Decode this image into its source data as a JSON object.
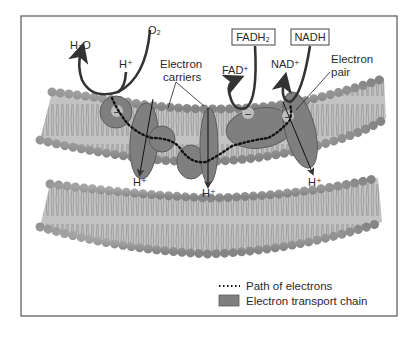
{
  "diagram": {
    "labels": {
      "h2o": "H₂O",
      "o2": "O₂",
      "h_plus_top": "H⁺",
      "electron_carriers_line1": "Electron",
      "electron_carriers_line2": "carriers",
      "fadh2": "FADH₂",
      "nadh": "NADH",
      "fad_plus": "FAD⁺",
      "nad_plus": "NAD⁺",
      "electron_pair_line1": "Electron",
      "electron_pair_line2": "pair",
      "h_plus_1": "H⁺",
      "h_plus_2": "H⁺",
      "h_plus_3": "H⁺",
      "electron_symbol": "–"
    },
    "legend": {
      "path": "Path of electrons",
      "chain": "Electron transport chain"
    },
    "colors": {
      "membrane": "#b9b9b9",
      "head": "#9a9a9a",
      "protein": "#7d7d7d",
      "arrow": "#333333",
      "frame": "#555555"
    }
  }
}
